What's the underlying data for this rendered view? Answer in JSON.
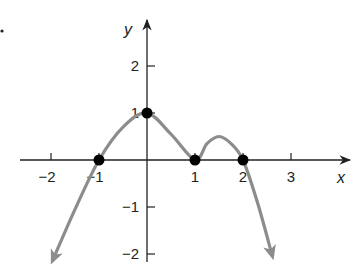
{
  "chart_data": {
    "type": "line",
    "title": "",
    "xlabel": "x",
    "ylabel": "y",
    "xlim": [
      -2.5,
      3.6
    ],
    "ylim": [
      -2.2,
      2.8
    ],
    "grid": false,
    "legend": null,
    "x_ticks": [
      -2,
      -1,
      1,
      2,
      3
    ],
    "x_tick_labels": [
      "−2",
      "−1",
      "1",
      "2",
      "3"
    ],
    "y_ticks": [
      2,
      1,
      -1,
      -2
    ],
    "y_tick_labels": [
      "2",
      "1",
      "−1",
      "−2"
    ],
    "series": [
      {
        "name": "f(x)",
        "color": "#8c8c8c",
        "x": [
          -1.95,
          -1.5,
          -1,
          -0.5,
          0,
          0.5,
          1,
          1.25,
          1.5,
          1.75,
          2,
          2.3,
          2.6
        ],
        "y": [
          -2.1,
          -1.05,
          0,
          0.7,
          1,
          0.55,
          0,
          0.35,
          0.5,
          0.35,
          0,
          -0.9,
          -2.0
        ],
        "arrows": "both ends (curve continues downward)"
      }
    ],
    "marked_points": [
      {
        "x": -1,
        "y": 0,
        "label": "x-intercept"
      },
      {
        "x": 0,
        "y": 1,
        "label": "y-intercept"
      },
      {
        "x": 1,
        "y": 0,
        "label": "x-intercept"
      },
      {
        "x": 2,
        "y": 0,
        "label": "x-intercept"
      }
    ],
    "point_color": "#000000",
    "axis_color": "#231f20"
  }
}
